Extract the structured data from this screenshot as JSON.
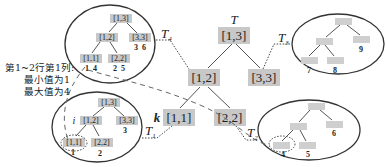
{
  "main_tree": {
    "label": "T",
    "root": "[1,3]",
    "left": "[1,2]",
    "right": "[3,3]",
    "left_left": "[1,1]",
    "left_right": "[2,2]",
    "k_label": "k"
  },
  "subtree_links": {
    "t1": "T",
    "t1_sub": "1",
    "t2": "T",
    "t2_sub": "2",
    "t3": "T",
    "t3_sub": "3",
    "t4": "T",
    "t4_sub": "4"
  },
  "t4_tree": {
    "root": "[1,3]",
    "left": "[1,2]",
    "right": "[3,3]",
    "left_left": "[1,1]",
    "left_right": "[2,2]",
    "left_left_values": "1  4",
    "left_right_values": "2  5",
    "right_values": "3  6"
  },
  "t1_tree": {
    "root": "[1,3]",
    "left": "[1,2]",
    "right": "[3,3]",
    "left_left": "[1,1]",
    "left_right": "[2,2]",
    "i_label": "i",
    "left_left_value": "1",
    "left_right_value": "2",
    "right_value": "3"
  },
  "t2_tree": {
    "leaf_values": [
      "4",
      "5",
      "6"
    ]
  },
  "t3_tree": {
    "leaf_values": [
      "7",
      "8",
      "9"
    ]
  },
  "annotation": {
    "line1": "第1~2行第1列:",
    "line2": "最小值为1",
    "line3": "最大值为4"
  }
}
